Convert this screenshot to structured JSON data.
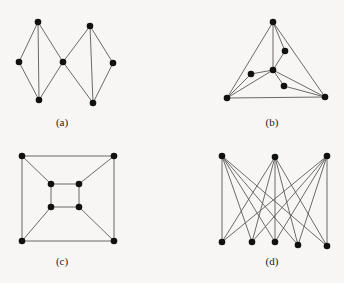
{
  "figures": [
    {
      "id": "a",
      "label": "(a)",
      "label_pos": [
        62,
        126
      ],
      "nodes": [
        [
          38,
          22
        ],
        [
          19,
          62
        ],
        [
          39,
          100
        ],
        [
          63,
          62
        ],
        [
          90,
          26
        ],
        [
          113,
          63
        ],
        [
          93,
          103
        ]
      ],
      "edges": [
        [
          0,
          1
        ],
        [
          1,
          2
        ],
        [
          0,
          2
        ],
        [
          0,
          3
        ],
        [
          2,
          3
        ],
        [
          3,
          4
        ],
        [
          3,
          6
        ],
        [
          4,
          5
        ],
        [
          5,
          6
        ],
        [
          4,
          6
        ]
      ]
    },
    {
      "id": "b",
      "label": "(b)",
      "label_pos": [
        272,
        126
      ],
      "nodes": [
        [
          273,
          22
        ],
        [
          285,
          51
        ],
        [
          273,
          70
        ],
        [
          251,
          74
        ],
        [
          284,
          86
        ],
        [
          227,
          98
        ],
        [
          325,
          97
        ]
      ],
      "edges": [
        [
          0,
          5
        ],
        [
          0,
          6
        ],
        [
          5,
          6
        ],
        [
          0,
          2
        ],
        [
          0,
          1
        ],
        [
          1,
          2
        ],
        [
          2,
          3
        ],
        [
          3,
          5
        ],
        [
          2,
          5
        ],
        [
          2,
          4
        ],
        [
          4,
          6
        ],
        [
          2,
          6
        ]
      ]
    },
    {
      "id": "c",
      "label": "(c)",
      "label_pos": [
        62,
        265
      ],
      "nodes": [
        [
          22,
          156
        ],
        [
          114,
          156
        ],
        [
          51,
          184
        ],
        [
          79,
          184
        ],
        [
          51,
          207
        ],
        [
          79,
          207
        ],
        [
          22,
          241
        ],
        [
          114,
          241
        ]
      ],
      "edges": [
        [
          0,
          1
        ],
        [
          1,
          7
        ],
        [
          7,
          6
        ],
        [
          6,
          0
        ],
        [
          2,
          3
        ],
        [
          3,
          5
        ],
        [
          5,
          4
        ],
        [
          4,
          2
        ],
        [
          0,
          2
        ],
        [
          1,
          3
        ],
        [
          6,
          4
        ],
        [
          7,
          5
        ]
      ]
    },
    {
      "id": "d",
      "label": "(d)",
      "label_pos": [
        272,
        265
      ],
      "nodes": [
        [
          222,
          156
        ],
        [
          275,
          157
        ],
        [
          327,
          156
        ],
        [
          222,
          242
        ],
        [
          252,
          242
        ],
        [
          275,
          242
        ],
        [
          298,
          245
        ],
        [
          327,
          246
        ]
      ],
      "edges": [
        [
          0,
          3
        ],
        [
          0,
          4
        ],
        [
          0,
          5
        ],
        [
          0,
          6
        ],
        [
          0,
          7
        ],
        [
          1,
          3
        ],
        [
          1,
          4
        ],
        [
          1,
          5
        ],
        [
          1,
          6
        ],
        [
          1,
          7
        ],
        [
          2,
          3
        ],
        [
          2,
          4
        ],
        [
          2,
          5
        ],
        [
          2,
          6
        ],
        [
          2,
          7
        ]
      ]
    }
  ],
  "colors": {
    "edge": "#5a5a5a",
    "node": "#111111",
    "background": "#f7f6f4"
  }
}
